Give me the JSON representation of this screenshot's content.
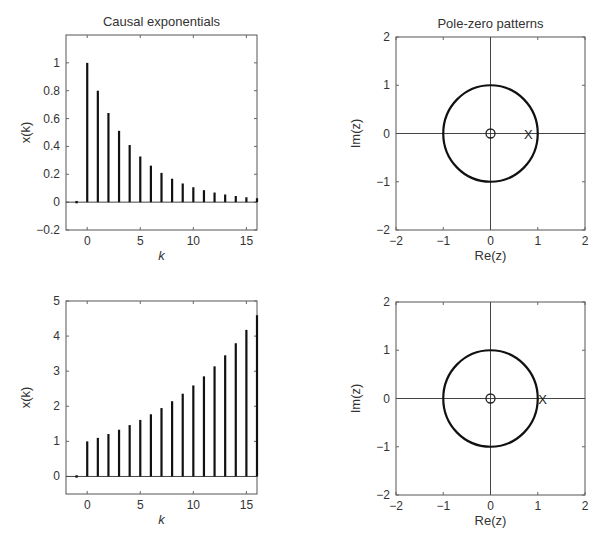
{
  "chart_data": [
    {
      "id": "causal-decaying",
      "type": "stem",
      "title": "Causal exponentials",
      "xlabel": "k",
      "ylabel": "x(k)",
      "xlim": [
        -2,
        16
      ],
      "ylim": [
        -0.2,
        1.2
      ],
      "xticks": [
        0,
        5,
        10,
        15
      ],
      "xtick_labels": [
        "0",
        "5",
        "10",
        "15"
      ],
      "yticks": [
        -0.2,
        0,
        0.2,
        0.4,
        0.6,
        0.8,
        1
      ],
      "ytick_labels": [
        "−0.2",
        "0",
        "0.2",
        "0.4",
        "0.6",
        "0.8",
        "1"
      ],
      "grid": false,
      "x": [
        -1,
        0,
        1,
        2,
        3,
        4,
        5,
        6,
        7,
        8,
        9,
        10,
        11,
        12,
        13,
        14,
        15,
        16
      ],
      "values": [
        0,
        1.0,
        0.8,
        0.64,
        0.512,
        0.41,
        0.328,
        0.262,
        0.21,
        0.168,
        0.134,
        0.107,
        0.086,
        0.069,
        0.055,
        0.044,
        0.035,
        0.028
      ]
    },
    {
      "id": "pole-zero-decaying",
      "type": "scatter",
      "title": "Pole-zero patterns",
      "xlabel": "Re(z)",
      "ylabel": "Im(z)",
      "xlim": [
        -2,
        2
      ],
      "ylim": [
        -2,
        2
      ],
      "xticks": [
        -2,
        -1,
        0,
        1,
        2
      ],
      "xtick_labels": [
        "−2",
        "−1",
        "0",
        "1",
        "2"
      ],
      "yticks": [
        -2,
        -1,
        0,
        1,
        2
      ],
      "ytick_labels": [
        "−2",
        "−1",
        "0",
        "1",
        "2"
      ],
      "grid": false,
      "unit_circle": true,
      "zeros": [
        {
          "re": 0,
          "im": 0,
          "marker": "O"
        }
      ],
      "poles": [
        {
          "re": 0.8,
          "im": 0,
          "marker": "X"
        }
      ]
    },
    {
      "id": "causal-growing",
      "type": "stem",
      "title": "",
      "xlabel": "k",
      "ylabel": "x(k)",
      "xlim": [
        -2,
        16
      ],
      "ylim": [
        -0.5,
        5
      ],
      "xticks": [
        0,
        5,
        10,
        15
      ],
      "xtick_labels": [
        "0",
        "5",
        "10",
        "15"
      ],
      "yticks": [
        0,
        1,
        2,
        3,
        4,
        5
      ],
      "ytick_labels": [
        "0",
        "1",
        "2",
        "3",
        "4",
        "5"
      ],
      "grid": false,
      "x": [
        -1,
        0,
        1,
        2,
        3,
        4,
        5,
        6,
        7,
        8,
        9,
        10,
        11,
        12,
        13,
        14,
        15,
        16
      ],
      "values": [
        0,
        1.0,
        1.1,
        1.21,
        1.331,
        1.464,
        1.611,
        1.772,
        1.949,
        2.144,
        2.358,
        2.594,
        2.853,
        3.138,
        3.452,
        3.797,
        4.177,
        4.595
      ]
    },
    {
      "id": "pole-zero-growing",
      "type": "scatter",
      "title": "",
      "xlabel": "Re(z)",
      "ylabel": "Im(z)",
      "xlim": [
        -2,
        2
      ],
      "ylim": [
        -2,
        2
      ],
      "xticks": [
        -2,
        -1,
        0,
        1,
        2
      ],
      "xtick_labels": [
        "−2",
        "−1",
        "0",
        "1",
        "2"
      ],
      "yticks": [
        -2,
        -1,
        0,
        1,
        2
      ],
      "ytick_labels": [
        "−2",
        "−1",
        "0",
        "1",
        "2"
      ],
      "grid": false,
      "unit_circle": true,
      "zeros": [
        {
          "re": 0,
          "im": 0,
          "marker": "O"
        }
      ],
      "poles": [
        {
          "re": 1.1,
          "im": 0,
          "marker": "X"
        }
      ]
    }
  ]
}
